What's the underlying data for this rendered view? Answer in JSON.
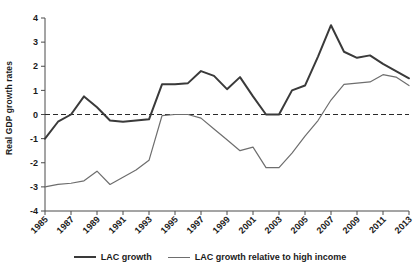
{
  "chart_data": {
    "type": "line",
    "title": "",
    "subtitle": "",
    "xlabel": "",
    "ylabel": "Real GDP growth rates",
    "xlim": [
      1985,
      2013
    ],
    "ylim": [
      -4,
      4
    ],
    "grid": false,
    "zero_reference_line": true,
    "legend_position": "bottom",
    "ytick_labels": [
      "4",
      "3",
      "2",
      "1",
      "0",
      "-1",
      "-2",
      "-3",
      "-4"
    ],
    "ytick_values": [
      4,
      3,
      2,
      1,
      0,
      -1,
      -2,
      -3,
      -4
    ],
    "xtick_labels": [
      "1985",
      "1987",
      "1989",
      "1991",
      "1993",
      "1995",
      "1997",
      "1999",
      "2001",
      "2003",
      "2005",
      "2007",
      "2009",
      "2011",
      "2013"
    ],
    "xtick_values": [
      1985,
      1987,
      1989,
      1991,
      1993,
      1995,
      1997,
      1999,
      2001,
      2003,
      2005,
      2007,
      2009,
      2011,
      2013
    ],
    "x": [
      1985,
      1986,
      1987,
      1988,
      1989,
      1990,
      1991,
      1992,
      1993,
      1994,
      1995,
      1996,
      1997,
      1998,
      1999,
      2000,
      2001,
      2002,
      2003,
      2004,
      2005,
      2006,
      2007,
      2008,
      2009,
      2010,
      2011,
      2012,
      2013
    ],
    "series": [
      {
        "name": "LAC growth",
        "color": "#3a3a3a",
        "line_width": 2,
        "values": [
          -1.0,
          -0.3,
          0.0,
          0.75,
          0.3,
          -0.25,
          -0.3,
          -0.25,
          -0.2,
          1.25,
          1.25,
          1.3,
          1.8,
          1.6,
          1.05,
          1.55,
          0.75,
          0.0,
          0.0,
          1.0,
          1.2,
          2.4,
          3.7,
          2.6,
          2.35,
          2.45,
          2.1,
          1.8,
          1.5
        ]
      },
      {
        "name": "LAC growth relative to high income",
        "color": "#6e6e6e",
        "line_width": 1.2,
        "values": [
          -3.0,
          -2.9,
          -2.85,
          -2.75,
          -2.35,
          -2.9,
          -2.6,
          -2.3,
          -1.9,
          -0.05,
          0.0,
          0.0,
          -0.15,
          -0.6,
          -1.05,
          -1.5,
          -1.35,
          -2.2,
          -2.2,
          -1.6,
          -0.9,
          -0.25,
          0.6,
          1.25,
          1.3,
          1.35,
          1.65,
          1.55,
          1.2
        ]
      }
    ]
  },
  "legend": {
    "items": [
      {
        "label": "LAC growth"
      },
      {
        "label": "LAC growth relative to high income"
      }
    ]
  },
  "axis": {
    "ylabel": "Real GDP growth rates"
  },
  "colors": {
    "lac_growth": "#3a3a3a",
    "lac_relative": "#6e6e6e",
    "axis": "#4a4a4a",
    "zero_line": "#2a2a2a"
  }
}
